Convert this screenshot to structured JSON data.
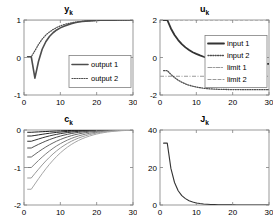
{
  "figure": {
    "background": "#ffffff",
    "axis_color": "#808080",
    "text_color": "#000000"
  },
  "chart_data": [
    {
      "type": "line",
      "id": "yk",
      "title": "y",
      "title_sub": "k",
      "xlabel": "",
      "ylabel": "",
      "xlim": [
        0,
        30
      ],
      "ylim": [
        -1,
        1
      ],
      "xticks": [
        0,
        10,
        20,
        30
      ],
      "yticks": [
        -1,
        0,
        1
      ],
      "xticklabels": [
        "0",
        "10",
        "20",
        "30"
      ],
      "yticklabels": [
        "-1",
        "0",
        "1"
      ],
      "grid": false,
      "legend_position": "center-right",
      "legend": [
        "output 1",
        "output 2"
      ],
      "x": [
        1,
        2,
        3,
        4,
        5,
        6,
        7,
        8,
        9,
        10,
        11,
        12,
        13,
        14,
        15,
        16,
        17,
        18,
        19,
        20,
        21,
        22,
        23,
        24,
        25,
        26,
        27,
        28,
        29,
        30
      ],
      "series": [
        {
          "name": "output 1",
          "style": "solid",
          "color": "#4d4d4d",
          "width": 1.6,
          "values": [
            0.02,
            0.02,
            -0.55,
            -0.1,
            0.22,
            0.42,
            0.56,
            0.66,
            0.735,
            0.79,
            0.835,
            0.87,
            0.9,
            0.925,
            0.945,
            0.96,
            0.97,
            0.978,
            0.984,
            0.989,
            0.992,
            0.994,
            0.996,
            0.997,
            0.998,
            0.999,
            0.999,
            1.0,
            1.0,
            1.0
          ]
        },
        {
          "name": "output 2",
          "style": "dotted",
          "color": "#4d4d4d",
          "width": 1.2,
          "values": [
            0.02,
            0.02,
            0.18,
            0.35,
            0.49,
            0.6,
            0.68,
            0.745,
            0.8,
            0.843,
            0.877,
            0.903,
            0.924,
            0.94,
            0.953,
            0.964,
            0.972,
            0.979,
            0.984,
            0.988,
            0.991,
            0.993,
            0.995,
            0.996,
            0.997,
            0.998,
            0.999,
            0.999,
            1.0,
            1.0
          ]
        }
      ],
      "reference_lines": [
        {
          "name": "setpoint",
          "y": 1.0,
          "style": "solid",
          "color": "#b3b3b3"
        }
      ]
    },
    {
      "type": "line",
      "id": "uk",
      "title": "u",
      "title_sub": "k",
      "xlabel": "",
      "ylabel": "",
      "xlim": [
        0,
        30
      ],
      "ylim": [
        -2,
        2
      ],
      "xticks": [
        0,
        10,
        20,
        30
      ],
      "yticks": [
        -2,
        0,
        2
      ],
      "xticklabels": [
        "0",
        "10",
        "20",
        "30"
      ],
      "yticklabels": [
        "-2",
        "0",
        "2"
      ],
      "grid": false,
      "legend_position": "center-right",
      "legend": [
        "input 1",
        "input 2",
        "limit 1",
        "limit 2"
      ],
      "x": [
        1,
        2,
        3,
        4,
        5,
        6,
        7,
        8,
        9,
        10,
        11,
        12,
        13,
        14,
        15,
        16,
        17,
        18,
        19,
        20,
        21,
        22,
        23,
        24,
        25,
        26,
        27,
        28,
        29,
        30
      ],
      "series": [
        {
          "name": "input 1",
          "style": "solid",
          "color": "#333333",
          "width": 1.8,
          "values": [
            2.0,
            2.0,
            1.55,
            1.2,
            0.93,
            0.71,
            0.54,
            0.4,
            0.28,
            0.19,
            0.11,
            0.04,
            -0.02,
            -0.07,
            -0.12,
            -0.16,
            -0.2,
            -0.23,
            -0.25,
            -0.27,
            -0.285,
            -0.3,
            -0.31,
            -0.32,
            -0.325,
            -0.33,
            -0.335,
            -0.34,
            -0.34,
            -0.34
          ]
        },
        {
          "name": "input 2",
          "style": "dotted",
          "color": "#4d4d4d",
          "width": 1.3,
          "values": [
            -0.7,
            -0.7,
            -0.9,
            -1.07,
            -1.21,
            -1.32,
            -1.41,
            -1.48,
            -1.53,
            -1.575,
            -1.61,
            -1.64,
            -1.66,
            -1.675,
            -1.687,
            -1.695,
            -1.7,
            -1.705,
            -1.708,
            -1.71,
            -1.712,
            -1.713,
            -1.714,
            -1.715,
            -1.715,
            -1.716,
            -1.716,
            -1.716,
            -1.716,
            -1.716
          ]
        }
      ],
      "reference_lines": [
        {
          "name": "limit 1",
          "y": -1.0,
          "style": "dashdot",
          "color": "#999999"
        },
        {
          "name": "limit 2",
          "y": 2.0,
          "style": "dashed",
          "color": "#999999"
        }
      ]
    },
    {
      "type": "line",
      "id": "ck",
      "title": "c",
      "title_sub": "k",
      "xlabel": "",
      "ylabel": "",
      "xlim": [
        0,
        30
      ],
      "ylim": [
        -2,
        0
      ],
      "xticks": [
        0,
        10,
        20,
        30
      ],
      "yticks": [
        -2,
        -1,
        0
      ],
      "xticklabels": [
        "0",
        "10",
        "20",
        "30"
      ],
      "yticklabels": [
        "-2",
        "-1",
        "0"
      ],
      "grid": false,
      "legend_position": "none",
      "legend": [],
      "x": [
        1,
        2,
        3,
        4,
        5,
        6,
        7,
        8,
        9,
        10,
        11,
        12,
        13,
        14,
        15,
        16,
        17,
        18,
        19,
        20,
        21,
        22,
        23,
        24,
        25,
        26,
        27,
        28,
        29,
        30
      ],
      "series": [
        {
          "name": "c-1",
          "style": "solid",
          "color": "#1a1a1a",
          "width": 1.0,
          "values": [
            -0.06,
            -0.06,
            -0.055,
            -0.05,
            -0.045,
            -0.04,
            -0.035,
            -0.03,
            -0.026,
            -0.022,
            -0.018,
            -0.015,
            -0.012,
            -0.01,
            -0.008,
            -0.006,
            -0.005,
            -0.004,
            -0.003,
            -0.002,
            -0.002,
            -0.001,
            -0.001,
            -0.001,
            0.0,
            0.0,
            0.0,
            0.0,
            0.0,
            0.0
          ]
        },
        {
          "name": "c-2",
          "style": "solid",
          "color": "#262626",
          "width": 1.0,
          "values": [
            -0.16,
            -0.16,
            -0.145,
            -0.13,
            -0.115,
            -0.1,
            -0.087,
            -0.075,
            -0.064,
            -0.054,
            -0.045,
            -0.037,
            -0.03,
            -0.024,
            -0.019,
            -0.015,
            -0.012,
            -0.009,
            -0.007,
            -0.005,
            -0.004,
            -0.003,
            -0.002,
            -0.002,
            -0.001,
            -0.001,
            0.0,
            0.0,
            0.0,
            0.0
          ]
        },
        {
          "name": "c-3",
          "style": "solid",
          "color": "#333333",
          "width": 1.0,
          "values": [
            -0.3,
            -0.3,
            -0.27,
            -0.24,
            -0.21,
            -0.183,
            -0.158,
            -0.136,
            -0.116,
            -0.098,
            -0.082,
            -0.068,
            -0.056,
            -0.045,
            -0.036,
            -0.029,
            -0.023,
            -0.018,
            -0.014,
            -0.011,
            -0.008,
            -0.006,
            -0.005,
            -0.004,
            -0.003,
            -0.002,
            -0.001,
            -0.001,
            0.0,
            0.0
          ]
        },
        {
          "name": "c-4",
          "style": "solid",
          "color": "#4d4d4d",
          "width": 1.0,
          "values": [
            -0.48,
            -0.48,
            -0.43,
            -0.383,
            -0.338,
            -0.296,
            -0.257,
            -0.222,
            -0.19,
            -0.162,
            -0.137,
            -0.115,
            -0.095,
            -0.078,
            -0.063,
            -0.051,
            -0.04,
            -0.032,
            -0.025,
            -0.019,
            -0.015,
            -0.011,
            -0.008,
            -0.006,
            -0.005,
            -0.003,
            -0.002,
            -0.002,
            -0.001,
            0.0
          ]
        },
        {
          "name": "c-5",
          "style": "solid",
          "color": "#666666",
          "width": 1.0,
          "values": [
            -0.72,
            -0.72,
            -0.65,
            -0.58,
            -0.515,
            -0.453,
            -0.396,
            -0.344,
            -0.296,
            -0.254,
            -0.216,
            -0.183,
            -0.153,
            -0.127,
            -0.105,
            -0.086,
            -0.069,
            -0.055,
            -0.044,
            -0.034,
            -0.027,
            -0.021,
            -0.016,
            -0.012,
            -0.009,
            -0.007,
            -0.005,
            -0.004,
            -0.003,
            0.0
          ]
        },
        {
          "name": "c-6",
          "style": "solid",
          "color": "#7f7f7f",
          "width": 1.0,
          "values": [
            -1.0,
            -1.0,
            -0.905,
            -0.812,
            -0.722,
            -0.638,
            -0.56,
            -0.488,
            -0.423,
            -0.365,
            -0.313,
            -0.267,
            -0.226,
            -0.19,
            -0.159,
            -0.132,
            -0.108,
            -0.088,
            -0.071,
            -0.057,
            -0.045,
            -0.035,
            -0.027,
            -0.021,
            -0.016,
            -0.012,
            -0.009,
            -0.007,
            -0.005,
            0.0
          ]
        },
        {
          "name": "c-7",
          "style": "solid",
          "color": "#999999",
          "width": 1.0,
          "values": [
            -1.28,
            -1.28,
            -1.16,
            -1.045,
            -0.932,
            -0.826,
            -0.728,
            -0.637,
            -0.555,
            -0.48,
            -0.414,
            -0.355,
            -0.302,
            -0.256,
            -0.216,
            -0.18,
            -0.15,
            -0.123,
            -0.1,
            -0.081,
            -0.065,
            -0.051,
            -0.04,
            -0.031,
            -0.024,
            -0.018,
            -0.013,
            -0.01,
            -0.007,
            0.0
          ]
        },
        {
          "name": "c-8",
          "style": "solid",
          "color": "#a6a6a6",
          "width": 1.0,
          "values": [
            -1.58,
            -1.58,
            -1.44,
            -1.3,
            -1.165,
            -1.036,
            -0.916,
            -0.805,
            -0.703,
            -0.611,
            -0.528,
            -0.454,
            -0.388,
            -0.33,
            -0.279,
            -0.234,
            -0.196,
            -0.162,
            -0.133,
            -0.108,
            -0.087,
            -0.069,
            -0.054,
            -0.042,
            -0.032,
            -0.024,
            -0.018,
            -0.013,
            -0.009,
            0.0
          ]
        }
      ],
      "reference_lines": []
    },
    {
      "type": "line",
      "id": "jk",
      "title": "J",
      "title_sub": "k",
      "xlabel": "",
      "ylabel": "",
      "xlim": [
        0,
        30
      ],
      "ylim": [
        0,
        40
      ],
      "xticks": [
        0,
        10,
        20,
        30
      ],
      "yticks": [
        0,
        20,
        40
      ],
      "xticklabels": [
        "0",
        "10",
        "20",
        "30"
      ],
      "yticklabels": [
        "0",
        "20",
        "40"
      ],
      "grid": false,
      "legend_position": "none",
      "legend": [],
      "x": [
        1,
        2,
        3,
        4,
        5,
        6,
        7,
        8,
        9,
        10,
        11,
        12,
        13,
        14,
        15,
        16,
        17,
        18,
        19,
        20,
        21,
        22,
        23,
        24,
        25,
        26,
        27,
        28,
        29,
        30
      ],
      "series": [
        {
          "name": "J",
          "style": "solid",
          "color": "#333333",
          "width": 1.1,
          "values": [
            33.0,
            33.0,
            19.5,
            12.0,
            7.6,
            5.0,
            3.4,
            2.3,
            1.6,
            1.1,
            0.78,
            0.55,
            0.4,
            0.29,
            0.21,
            0.15,
            0.11,
            0.08,
            0.06,
            0.045,
            0.033,
            0.024,
            0.018,
            0.013,
            0.01,
            0.007,
            0.005,
            0.004,
            0.003,
            0.002
          ]
        }
      ],
      "reference_lines": []
    }
  ]
}
